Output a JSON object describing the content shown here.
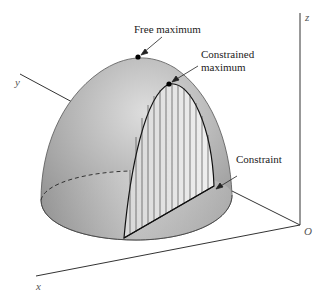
{
  "figure": {
    "labels": {
      "free_maximum": "Free maximum",
      "constrained_line1": "Constrained",
      "constrained_line2": "maximum",
      "constraint": "Constraint"
    },
    "axes": {
      "x": "x",
      "y": "y",
      "z": "z",
      "origin": "O"
    },
    "colors": {
      "surface_dark": "#8a8a8a",
      "surface_light": "#e6e6e6",
      "line": "#1a1a1a"
    }
  }
}
